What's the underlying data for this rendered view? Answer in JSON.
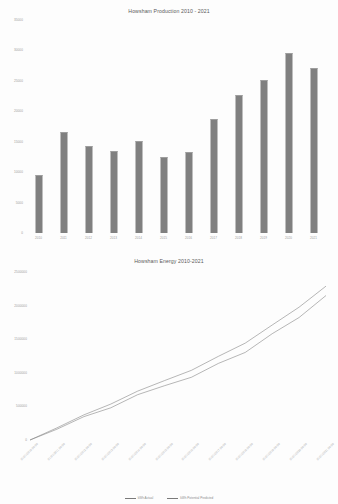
{
  "document": {
    "page_background": "#fdfdfd",
    "bar_color": "#808080",
    "line_color": "#7a7a7a",
    "axis_text_color": "#9a9a9a"
  },
  "chart_data": [
    {
      "type": "bar",
      "title": "Howsham Production 2010 - 2021",
      "xlabel": "",
      "ylabel": "",
      "grid": false,
      "legend": "none",
      "categories": [
        "2010",
        "2011",
        "2012",
        "2013",
        "2014",
        "2015",
        "2016",
        "2017",
        "2018",
        "2019",
        "2020",
        "2021"
      ],
      "values": [
        9500,
        16600,
        14300,
        13500,
        15100,
        12500,
        13300,
        18700,
        22700,
        25200,
        29600,
        27100
      ],
      "ylim": [
        0,
        35000
      ],
      "yticks": [
        0,
        5000,
        10000,
        15000,
        20000,
        25000,
        30000,
        35000
      ],
      "ytick_labels": [
        "0",
        "5000",
        "10000",
        "15000",
        "20000",
        "25000",
        "30000",
        "35000"
      ]
    },
    {
      "type": "line",
      "title": "Howsham Energy 2010-2021",
      "xlabel": "",
      "ylabel": "",
      "grid": false,
      "legend": "bottom",
      "categories": [
        "01/01/2010 00:00",
        "01/01/2011 00:00",
        "01/01/2012 00:00",
        "01/01/2013 00:00",
        "01/01/2014 00:00",
        "01/01/2015 00:00",
        "01/01/2016 00:00",
        "01/01/2017 00:00",
        "01/01/2018 00:00",
        "01/01/2019 00:00",
        "01/01/2020 00:00",
        "01/01/2021 00:00"
      ],
      "ylim": [
        0,
        2500000
      ],
      "yticks": [
        0,
        500000,
        1000000,
        1500000,
        2000000,
        2500000
      ],
      "ytick_labels": [
        "0",
        "500000",
        "1000000",
        "1500000",
        "2000000",
        "2500000"
      ],
      "series": [
        {
          "name": "kWh Actual",
          "values": [
            0,
            170000,
            340000,
            500000,
            660000,
            820000,
            960000,
            1130000,
            1320000,
            1560000,
            1830000,
            2150000
          ]
        },
        {
          "name": "kWh Potential Predicted",
          "values": [
            0,
            185000,
            370000,
            545000,
            720000,
            890000,
            1050000,
            1240000,
            1450000,
            1700000,
            1980000,
            2290000
          ]
        }
      ]
    }
  ]
}
